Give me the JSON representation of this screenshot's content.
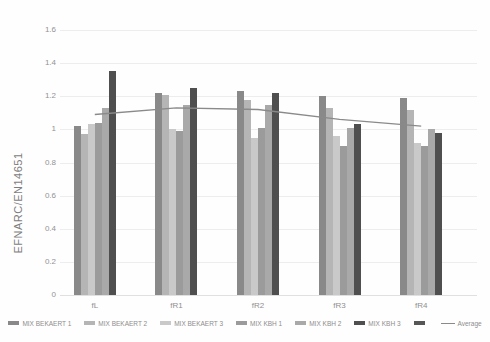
{
  "chart_data": {
    "type": "bar",
    "title": "",
    "xlabel": "",
    "ylabel": "EFNARC/EN14651",
    "ylim": [
      0,
      1.6
    ],
    "ytick_step": 0.2,
    "yticks": [
      "0",
      "0.2",
      "0.4",
      "0.6",
      "0.8",
      "1",
      "1.2",
      "1.4",
      "1.6"
    ],
    "grid": true,
    "legend_position": "bottom",
    "categories": [
      "fL",
      "fR1",
      "fR2",
      "fR3",
      "fR4"
    ],
    "series": [
      {
        "name": "MIX BEKAERT 1",
        "color": "#898989",
        "values": [
          1.02,
          1.22,
          1.23,
          1.2,
          1.19
        ]
      },
      {
        "name": "MIX BEKAERT 2",
        "color": "#b5b5b5",
        "values": [
          0.97,
          1.21,
          1.18,
          1.13,
          1.12
        ]
      },
      {
        "name": "MIX BEKAERT 3",
        "color": "#c9c9c9",
        "values": [
          1.03,
          1.0,
          0.95,
          0.96,
          0.92
        ]
      },
      {
        "name": "MIX KBH 1",
        "color": "#9b9b9b",
        "values": [
          1.04,
          0.99,
          1.01,
          0.9,
          0.9
        ]
      },
      {
        "name": "MIX KBH 2",
        "color": "#a9a9a9",
        "values": [
          1.13,
          1.15,
          1.15,
          1.01,
          1.0
        ]
      },
      {
        "name": "MIX KBH 3",
        "color": "#4f4f4f",
        "values": [
          1.35,
          1.25,
          1.22,
          1.03,
          0.98
        ]
      }
    ],
    "extra_legend_swatch": {
      "name": "",
      "color": "#565656"
    },
    "line_series": {
      "name": "Average",
      "color": "#8a8a8a",
      "values": [
        1.09,
        1.13,
        1.12,
        1.06,
        1.02
      ]
    }
  },
  "colors": {
    "background": "#fffefe",
    "grid": "#ededed",
    "zero_line": "#e0e0e0",
    "axis_text": "#8f8f8f",
    "ytitle_text": "#7d7d7d"
  }
}
